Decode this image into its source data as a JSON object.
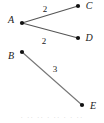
{
  "figure": {
    "width": 104,
    "height": 123,
    "background": "#ffffff",
    "line_color": "#555555",
    "node_color": "#111111",
    "text_color": "#1a1a1a"
  },
  "nodes": [
    {
      "id": "A",
      "label": "A",
      "x": 22,
      "y": 23,
      "label_x": 11,
      "label_y": 20
    },
    {
      "id": "B",
      "label": "B",
      "x": 22,
      "y": 52,
      "label_x": 11,
      "label_y": 56
    },
    {
      "id": "C",
      "label": "C",
      "x": 78,
      "y": 6,
      "label_x": 89,
      "label_y": 6
    },
    {
      "id": "D",
      "label": "D",
      "x": 78,
      "y": 38,
      "label_x": 89,
      "label_y": 38
    },
    {
      "id": "E",
      "label": "E",
      "x": 82,
      "y": 105,
      "label_x": 93,
      "label_y": 106
    }
  ],
  "edges": [
    {
      "id": "AC",
      "from": "A",
      "to": "C",
      "weight": "2",
      "label_x": 45,
      "label_y": 9
    },
    {
      "id": "AD",
      "from": "A",
      "to": "D",
      "weight": "2",
      "label_x": 44,
      "label_y": 41
    },
    {
      "id": "BE",
      "from": "B",
      "to": "E",
      "weight": "3",
      "label_x": 55,
      "label_y": 69
    }
  ],
  "bottom_artifact": {
    "text": "· ·· ·· · ·· · · ··"
  }
}
